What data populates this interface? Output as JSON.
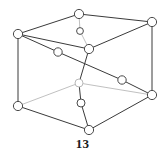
{
  "figure": {
    "caption": "13",
    "background_color": "#ffffff",
    "edge_color_front": "#3a3a3a",
    "edge_color_hidden": "#b9b9b9",
    "node_stroke_color": "#4a4a4a",
    "node_fill_color": "#ffffff",
    "edge_width_front": 1.0,
    "edge_width_hidden": 0.9,
    "node_radius_large": 4.4,
    "node_radius_small": 3.4
  },
  "chart_data": {
    "type": "diagram",
    "title": "13",
    "layout": "3d-cube-perspective",
    "view_box": "0 0 165 162",
    "nodes": [
      {
        "id": "top-back-left",
        "label": "",
        "x": 18,
        "y": 34,
        "r": 4.6,
        "hidden": false
      },
      {
        "id": "top-front-center",
        "label": "",
        "x": 79,
        "y": 14,
        "r": 4.6,
        "hidden": false
      },
      {
        "id": "top-back-right",
        "label": "",
        "x": 152,
        "y": 22,
        "r": 4.6,
        "hidden": false
      },
      {
        "id": "top-inner-center",
        "label": "",
        "x": 80,
        "y": 31,
        "r": 3.4,
        "hidden": false
      },
      {
        "id": "mid-front-center",
        "label": "",
        "x": 89,
        "y": 49,
        "r": 4.6,
        "hidden": false
      },
      {
        "id": "diag-node-left",
        "label": "",
        "x": 58,
        "y": 52,
        "r": 4.2,
        "hidden": false
      },
      {
        "id": "diag-node-right",
        "label": "",
        "x": 122,
        "y": 80,
        "r": 4.2,
        "hidden": false
      },
      {
        "id": "center-upper",
        "label": "",
        "x": 79,
        "y": 83,
        "r": 4.0,
        "hidden": true
      },
      {
        "id": "center-lower",
        "label": "",
        "x": 81,
        "y": 103,
        "r": 4.0,
        "hidden": false
      },
      {
        "id": "bottom-back-left",
        "label": "",
        "x": 18,
        "y": 106,
        "r": 4.6,
        "hidden": false
      },
      {
        "id": "bottom-right",
        "label": "",
        "x": 152,
        "y": 95,
        "r": 4.6,
        "hidden": false
      },
      {
        "id": "bottom-center",
        "label": "",
        "x": 89,
        "y": 130,
        "r": 4.6,
        "hidden": false
      }
    ],
    "edges": [
      {
        "from": "top-back-left",
        "to": "top-front-center",
        "hidden": false
      },
      {
        "from": "top-front-center",
        "to": "top-back-right",
        "hidden": false
      },
      {
        "from": "top-back-left",
        "to": "mid-front-center",
        "hidden": false
      },
      {
        "from": "mid-front-center",
        "to": "top-back-right",
        "hidden": false
      },
      {
        "from": "top-front-center",
        "to": "top-inner-center",
        "hidden": true
      },
      {
        "from": "top-inner-center",
        "to": "mid-front-center",
        "hidden": true
      },
      {
        "from": "top-back-left",
        "to": "bottom-back-left",
        "hidden": false
      },
      {
        "from": "top-back-right",
        "to": "bottom-right",
        "hidden": false
      },
      {
        "from": "mid-front-center",
        "to": "center-upper",
        "hidden": false
      },
      {
        "from": "center-upper",
        "to": "center-lower",
        "hidden": false
      },
      {
        "from": "center-lower",
        "to": "bottom-center",
        "hidden": false
      },
      {
        "from": "top-back-left",
        "to": "diag-node-left",
        "hidden": false
      },
      {
        "from": "diag-node-left",
        "to": "diag-node-right",
        "hidden": false
      },
      {
        "from": "diag-node-right",
        "to": "bottom-right",
        "hidden": false
      },
      {
        "from": "bottom-back-left",
        "to": "center-upper",
        "hidden": true
      },
      {
        "from": "center-upper",
        "to": "bottom-right",
        "hidden": true
      },
      {
        "from": "bottom-back-left",
        "to": "bottom-center",
        "hidden": false
      },
      {
        "from": "bottom-center",
        "to": "bottom-right",
        "hidden": false
      }
    ]
  }
}
